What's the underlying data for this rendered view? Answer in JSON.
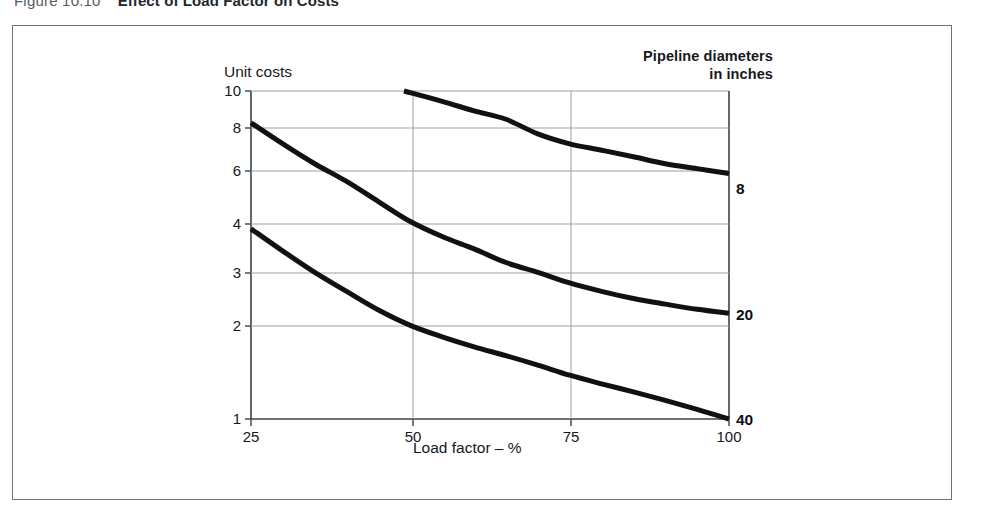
{
  "figure": {
    "number": "Figure 10.10",
    "title": "Effect of Load Factor on Costs"
  },
  "legend": {
    "line1": "Pipeline diameters",
    "line2": "in inches"
  },
  "axes": {
    "y_label": "Unit costs",
    "x_label": "Load factor – %",
    "y_ticks": [
      "1",
      "2",
      "3",
      "4",
      "6",
      "8",
      "10"
    ],
    "x_ticks": [
      "25",
      "50",
      "75",
      "100"
    ]
  },
  "series_labels": {
    "d8": "8",
    "d20": "20",
    "d40": "40"
  },
  "chart_data": {
    "type": "line",
    "title": "Effect of Load Factor on Costs",
    "xlabel": "Load factor – %",
    "ylabel": "Unit costs",
    "xlim": [
      25,
      100
    ],
    "ylim": [
      1,
      10
    ],
    "yscale": "log",
    "xscale": "linear",
    "grid": true,
    "xticks": [
      25,
      50,
      75,
      100
    ],
    "yticks": [
      1,
      2,
      3,
      4,
      6,
      8,
      10
    ],
    "legend_title": "Pipeline diameters in inches",
    "legend_position": "right-of-curve-ends",
    "series": [
      {
        "name": "8",
        "label": "8",
        "x": [
          49,
          55,
          60,
          65,
          70,
          75,
          80,
          85,
          90,
          95,
          100
        ],
        "y": [
          10.0,
          9.3,
          8.7,
          8.2,
          7.4,
          6.9,
          6.6,
          6.3,
          6.0,
          5.8,
          5.6
        ]
      },
      {
        "name": "20",
        "label": "20",
        "x": [
          25,
          30,
          35,
          40,
          45,
          50,
          55,
          60,
          65,
          70,
          75,
          80,
          85,
          90,
          95,
          100
        ],
        "y": [
          8.0,
          6.9,
          6.0,
          5.3,
          4.6,
          4.0,
          3.6,
          3.3,
          3.0,
          2.8,
          2.6,
          2.45,
          2.33,
          2.24,
          2.16,
          2.1
        ]
      },
      {
        "name": "40",
        "label": "40",
        "x": [
          25,
          30,
          35,
          40,
          45,
          50,
          55,
          60,
          65,
          70,
          75,
          80,
          85,
          90,
          95,
          100
        ],
        "y": [
          3.8,
          3.25,
          2.8,
          2.45,
          2.15,
          1.93,
          1.78,
          1.66,
          1.56,
          1.46,
          1.36,
          1.28,
          1.21,
          1.14,
          1.07,
          1.0
        ]
      }
    ]
  },
  "colors": {
    "curve": "#111111",
    "grid": "#9b9fa2",
    "axis": "#3d4144",
    "frame": "#6f7376",
    "text": "#15181b"
  }
}
